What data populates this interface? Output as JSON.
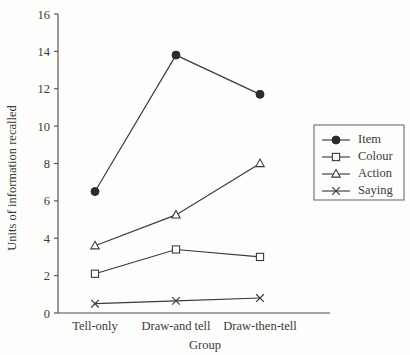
{
  "chart_data": {
    "type": "line",
    "title": "",
    "xlabel": "Group",
    "ylabel": "Units of information recalled",
    "categories": [
      "Tell-only",
      "Draw-and tell",
      "Draw-then-tell"
    ],
    "ylim": [
      0,
      16
    ],
    "yticks": [
      0,
      2,
      4,
      6,
      8,
      10,
      12,
      14,
      16
    ],
    "grid": false,
    "legend_position": "right",
    "series": [
      {
        "name": "Item",
        "marker": "filled-circle",
        "values": [
          6.5,
          13.8,
          11.7
        ]
      },
      {
        "name": "Colour",
        "marker": "open-square",
        "values": [
          2.1,
          3.4,
          3.0
        ]
      },
      {
        "name": "Action",
        "marker": "open-triangle",
        "values": [
          3.6,
          5.25,
          8.0
        ]
      },
      {
        "name": "Saying",
        "marker": "cross",
        "values": [
          0.5,
          0.65,
          0.8
        ]
      }
    ]
  },
  "legend": {
    "entries": [
      "Item",
      "Colour",
      "Action",
      "Saying"
    ]
  },
  "colors": {
    "ink": "#3a3a3a",
    "marker_fill": "#2b2b2b",
    "background": "#fdfdfc",
    "legend_border": "#6d6d6d"
  }
}
